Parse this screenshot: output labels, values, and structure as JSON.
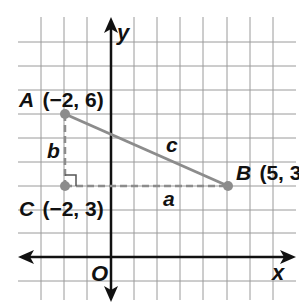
{
  "diagram": {
    "axes": {
      "x_label": "x",
      "y_label": "y",
      "origin_label": "O"
    },
    "points": [
      {
        "name": "A",
        "coords": "(−2, 6)",
        "x": -2,
        "y": 6
      },
      {
        "name": "B",
        "coords": "(5, 3)",
        "x": 5,
        "y": 3
      },
      {
        "name": "C",
        "coords": "(−2, 3)",
        "x": -2,
        "y": 3
      }
    ],
    "sides": {
      "a": "a",
      "b": "b",
      "c": "c"
    },
    "colors": {
      "grid": "#9a9a9a",
      "axis": "#111111",
      "segment": "#8c8c8c",
      "point": "#8c8c8c"
    }
  }
}
